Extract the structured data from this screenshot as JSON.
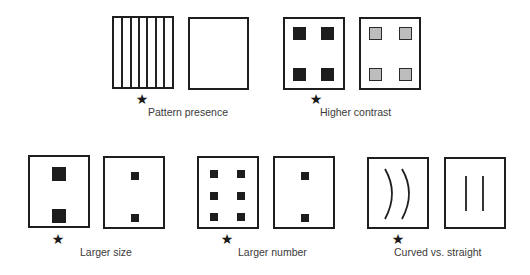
{
  "figure": {
    "marker_symbol": "★",
    "comparisons": [
      {
        "id": "pattern",
        "label": "Pattern presence",
        "preferred": "left",
        "left": {
          "type": "stripes",
          "stripe_count": 7
        },
        "right": {
          "type": "empty"
        }
      },
      {
        "id": "contrast",
        "label": "Higher contrast",
        "preferred": "left",
        "left": {
          "type": "squares",
          "count": 4,
          "fill": "dark",
          "color": "#1d1d1d"
        },
        "right": {
          "type": "squares",
          "count": 4,
          "fill": "light-gray",
          "color": "#bdbdbd"
        }
      },
      {
        "id": "size",
        "label": "Larger size",
        "preferred": "left",
        "left": {
          "type": "squares",
          "count": 2,
          "size": "large"
        },
        "right": {
          "type": "squares",
          "count": 2,
          "size": "small"
        }
      },
      {
        "id": "number",
        "label": "Larger number",
        "preferred": "left",
        "left": {
          "type": "squares",
          "count": 6,
          "size": "small"
        },
        "right": {
          "type": "squares",
          "count": 2,
          "size": "small"
        }
      },
      {
        "id": "curvature",
        "label": "Curved vs. straight",
        "preferred": "left",
        "left": {
          "type": "lines",
          "count": 2,
          "shape": "curved"
        },
        "right": {
          "type": "lines",
          "count": 2,
          "shape": "straight"
        }
      }
    ]
  }
}
